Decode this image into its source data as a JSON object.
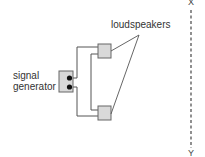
{
  "diagram": {
    "labels": {
      "loudspeakers": "loudspeakers",
      "signal_generator_line1": "signal",
      "signal_generator_line2": "generator",
      "axis_top": "X",
      "axis_bottom": "Y"
    },
    "colors": {
      "box_fill": "#d9d9d9",
      "box_stroke": "#666666",
      "wire": "#555555",
      "dot": "#111111",
      "dashed_line": "#555555"
    },
    "components": [
      {
        "name": "signal-generator",
        "terminals": 2
      },
      {
        "name": "loudspeaker-top"
      },
      {
        "name": "loudspeaker-bottom"
      }
    ]
  }
}
